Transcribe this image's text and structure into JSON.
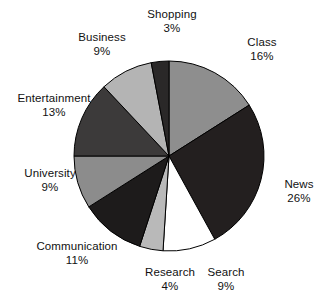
{
  "chart_data": {
    "type": "pie",
    "title": "",
    "subtitle": "",
    "xlabel": "",
    "ylabel": "",
    "legend_position": "none",
    "grid": false,
    "units": "percent",
    "label_format": "{name}\n{value}%",
    "start_angle_deg": -90,
    "direction": "clockwise",
    "categories": [
      "Class",
      "News",
      "Search",
      "Research",
      "Communication",
      "University",
      "Entertainment",
      "Business",
      "Shopping"
    ],
    "values": [
      16,
      26,
      9,
      4,
      11,
      9,
      13,
      9,
      3
    ],
    "colors": [
      "#8e8e8e",
      "#231f1f",
      "#ffffff",
      "#b9b9b9",
      "#1d1b1b",
      "#8c8c8c",
      "#3c3a3a",
      "#b4b4b4",
      "#2a2828"
    ],
    "slices": [
      {
        "name": "Class",
        "value": 16,
        "color": "#8e8e8e",
        "label_name": "Class",
        "label_value": "16%"
      },
      {
        "name": "News",
        "value": 26,
        "color": "#231f1f",
        "label_name": "News",
        "label_value": "26%"
      },
      {
        "name": "Search",
        "value": 9,
        "color": "#ffffff",
        "label_name": "Search",
        "label_value": "9%"
      },
      {
        "name": "Research",
        "value": 4,
        "color": "#b9b9b9",
        "label_name": "Research",
        "label_value": "4%"
      },
      {
        "name": "Communication",
        "value": 11,
        "color": "#1d1b1b",
        "label_name": "Communication",
        "label_value": "11%"
      },
      {
        "name": "University",
        "value": 9,
        "color": "#8c8c8c",
        "label_name": "University",
        "label_value": "9%"
      },
      {
        "name": "Entertainment",
        "value": 13,
        "color": "#3c3a3a",
        "label_name": "Entertainment",
        "label_value": "13%"
      },
      {
        "name": "Business",
        "value": 9,
        "color": "#b4b4b4",
        "label_name": "Business",
        "label_value": "9%"
      },
      {
        "name": "Shopping",
        "value": 3,
        "color": "#2a2828",
        "label_name": "Shopping",
        "label_value": "3%"
      }
    ],
    "total": 100,
    "geometry": {
      "center_x": 169,
      "center_y": 156,
      "radius": 95,
      "stroke_color": "#000000",
      "stroke_width": 1
    }
  }
}
